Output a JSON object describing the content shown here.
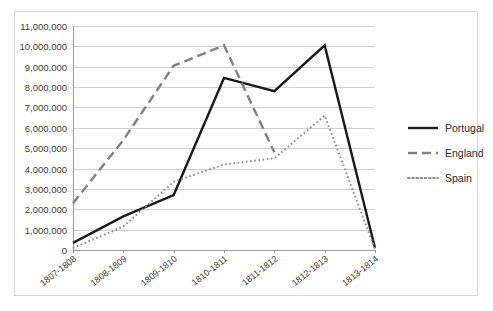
{
  "chart_data": {
    "type": "line",
    "title": "",
    "subtitle": "",
    "xlabel": "",
    "ylabel": "",
    "categories": [
      "1807-1808",
      "1808-1809",
      "1809-1810",
      "1810-1811",
      "1811-1812",
      "1812-1813",
      "1813-1814"
    ],
    "ylim": [
      0,
      11000000
    ],
    "ytick_step": 1000000,
    "ytick_labels": [
      "0",
      "1,000,000",
      "2,000,000",
      "3,000,000",
      "4,000,000",
      "5,000,000",
      "6,000,000",
      "7,000,000",
      "8,000,000",
      "9,000,000",
      "10,000,000",
      "11,000,000"
    ],
    "grid": true,
    "legend_position": "right",
    "series": [
      {
        "name": "Portugal",
        "style": "solid",
        "color": "#1a1a1a",
        "width": 2.4,
        "values": [
          350000,
          1650000,
          2700000,
          8450000,
          7800000,
          10050000,
          100000
        ]
      },
      {
        "name": "England",
        "style": "dashed",
        "color": "#808080",
        "width": 2.4,
        "values": [
          2300000,
          5400000,
          9050000,
          10050000,
          4800000,
          null,
          null
        ]
      },
      {
        "name": "Spain",
        "style": "dotted",
        "color": "#8c8c8c",
        "width": 2.0,
        "values": [
          100000,
          1150000,
          3350000,
          4200000,
          4500000,
          6600000,
          50000
        ]
      }
    ]
  },
  "legend": {
    "items": [
      {
        "label": "Portugal"
      },
      {
        "label": "England"
      },
      {
        "label": "Spain"
      }
    ]
  }
}
